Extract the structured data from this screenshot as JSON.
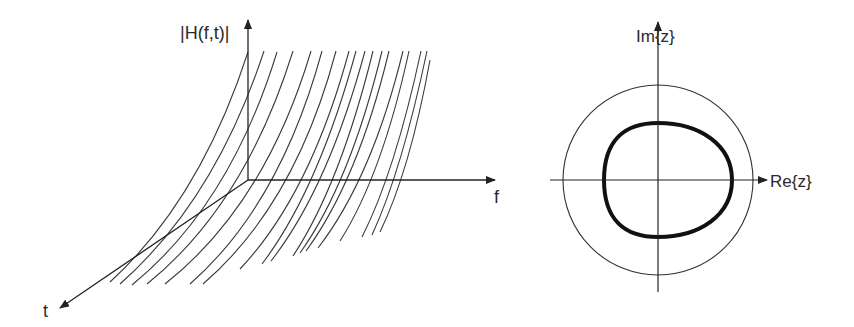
{
  "left_diagram": {
    "title": "Time-varying frequency response",
    "labels": {
      "magnitude": "|H(f,t)|",
      "freq_axis": "f",
      "time_axis": "t"
    },
    "curve_count": 18
  },
  "right_diagram": {
    "labels": {
      "imag_axis": "Im{z}",
      "real_axis": "Re{z}"
    },
    "outer_circle": "unit circle",
    "inner_curve": "thick closed contour"
  },
  "colors": {
    "line": "#333333",
    "background": "#ffffff"
  }
}
